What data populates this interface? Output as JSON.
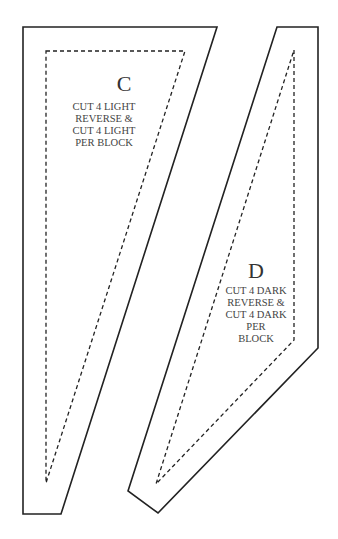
{
  "pieces": [
    {
      "letter": "C",
      "instructions": [
        "CUT 4 LIGHT",
        "REVERSE &",
        "CUT 4 LIGHT",
        "PER BLOCK"
      ]
    },
    {
      "letter": "D",
      "instructions": [
        "CUT 4 DARK",
        "REVERSE &",
        "CUT 4 DARK",
        "PER",
        "BLOCK"
      ]
    }
  ]
}
